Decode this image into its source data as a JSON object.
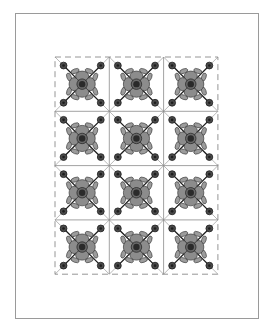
{
  "page": {
    "width": 270,
    "height": 331,
    "background": "#ffffff",
    "border": {
      "x": 15,
      "y": 13,
      "width": 243,
      "height": 305,
      "color": "#9a9a9a"
    }
  },
  "quilt": {
    "x": 55,
    "y": 57,
    "cols": 3,
    "rows": 4,
    "cell_size": 54.3,
    "outer_border_style": "dashed",
    "outer_border_color": "#8a8a8a",
    "grid_line_color": "#8a8a8a",
    "diagonal_color": "#9a9a9a",
    "motif": {
      "name": "floral-applique-block",
      "petal_color": "#8c8c8c",
      "petal_outline": "#3a3a3a",
      "center_color": "#2a2a2a",
      "berry_color": "#4a4a4a",
      "leaf_color": "#9c9c9c",
      "stem_color": "#1e1e1e"
    }
  }
}
